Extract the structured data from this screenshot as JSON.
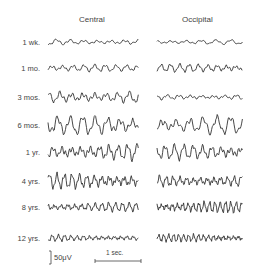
{
  "figure": {
    "columns": [
      {
        "title": "Central"
      },
      {
        "title": "Occipital"
      }
    ],
    "rows": [
      {
        "label": "1 wk.",
        "y": 42,
        "central": {
          "amp": 2.5,
          "freq": 1.1
        },
        "occipital": {
          "amp": 2.0,
          "freq": 1.0
        }
      },
      {
        "label": "1 mo.",
        "y": 68,
        "central": {
          "amp": 3.0,
          "freq": 1.4
        },
        "occipital": {
          "amp": 3.5,
          "freq": 1.6
        }
      },
      {
        "label": "3 mos.",
        "y": 97,
        "central": {
          "amp": 5.5,
          "freq": 1.3
        },
        "occipital": {
          "amp": 2.5,
          "freq": 1.3
        }
      },
      {
        "label": "6 mos.",
        "y": 125,
        "central": {
          "amp": 8.0,
          "freq": 1.2
        },
        "occipital": {
          "amp": 7.5,
          "freq": 1.1
        }
      },
      {
        "label": "1 yr.",
        "y": 152,
        "central": {
          "amp": 7.0,
          "freq": 1.6
        },
        "occipital": {
          "amp": 6.5,
          "freq": 1.6
        }
      },
      {
        "label": "4 yrs.",
        "y": 181,
        "central": {
          "amp": 6.5,
          "freq": 2.0
        },
        "occipital": {
          "amp": 5.5,
          "freq": 2.2
        }
      },
      {
        "label": "8 yrs.",
        "y": 207,
        "central": {
          "amp": 4.0,
          "freq": 2.2
        },
        "occipital": {
          "amp": 5.0,
          "freq": 2.8
        }
      },
      {
        "label": "12 yrs.",
        "y": 238,
        "central": {
          "amp": 3.0,
          "freq": 2.4
        },
        "occipital": {
          "amp": 3.5,
          "freq": 3.0
        }
      }
    ],
    "scale": {
      "amplitude_label": "50μV",
      "time_label": "1 sec."
    },
    "trace_color": "#333333"
  }
}
